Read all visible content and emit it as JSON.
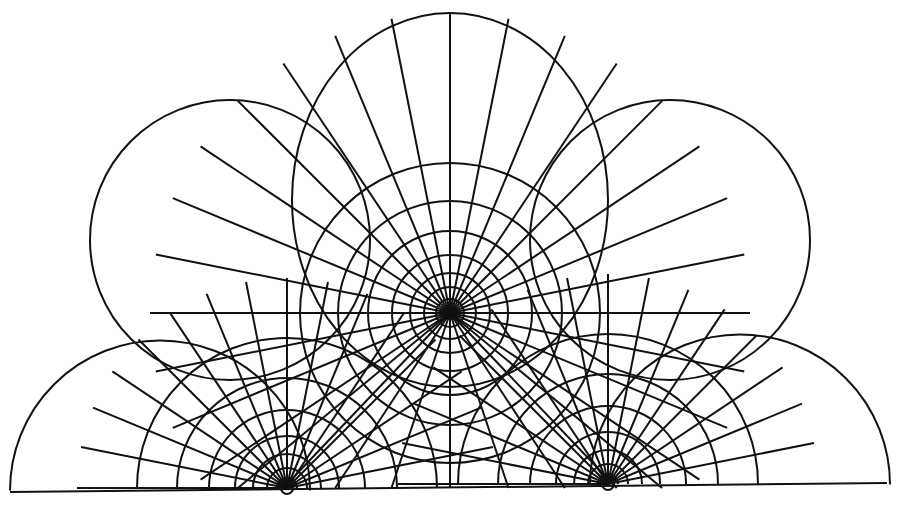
{
  "diagram": {
    "title": "",
    "stroke_color": "#111111",
    "background": "#ffffff",
    "baseline": {
      "x1": 10,
      "y1": 492,
      "x2": 887,
      "y2": 483
    },
    "foci": [
      {
        "name": "center",
        "x": 450,
        "y": 313
      },
      {
        "name": "left",
        "x": 287,
        "y": 488
      },
      {
        "name": "right",
        "x": 608,
        "y": 484
      }
    ],
    "outer_lobes": [
      {
        "name": "top",
        "cx": 450,
        "cy": 200,
        "rx": 158,
        "ry": 187
      },
      {
        "name": "upper-left",
        "cx": 230,
        "cy": 240,
        "r": 140
      },
      {
        "name": "upper-right",
        "cx": 670,
        "cy": 240,
        "r": 140
      },
      {
        "name": "lower-left",
        "cx": 160,
        "cy": 470,
        "r": 150
      },
      {
        "name": "lower-right",
        "cx": 740,
        "cy": 470,
        "r": 150
      }
    ]
  }
}
